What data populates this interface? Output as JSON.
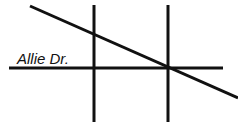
{
  "map": {
    "street_label": "Allie Dr.",
    "line_color": "#111111",
    "background": "#ffffff",
    "roads": [
      {
        "name": "allie-dr",
        "x1": 9,
        "y1": 68,
        "x2": 223,
        "y2": 68
      },
      {
        "name": "vertical-road-1",
        "x1": 94,
        "y1": 5,
        "x2": 94,
        "y2": 122
      },
      {
        "name": "vertical-road-2",
        "x1": 168,
        "y1": 5,
        "x2": 168,
        "y2": 122
      },
      {
        "name": "diagonal-road",
        "x1": 30,
        "y1": 6,
        "x2": 238,
        "y2": 98
      }
    ]
  }
}
